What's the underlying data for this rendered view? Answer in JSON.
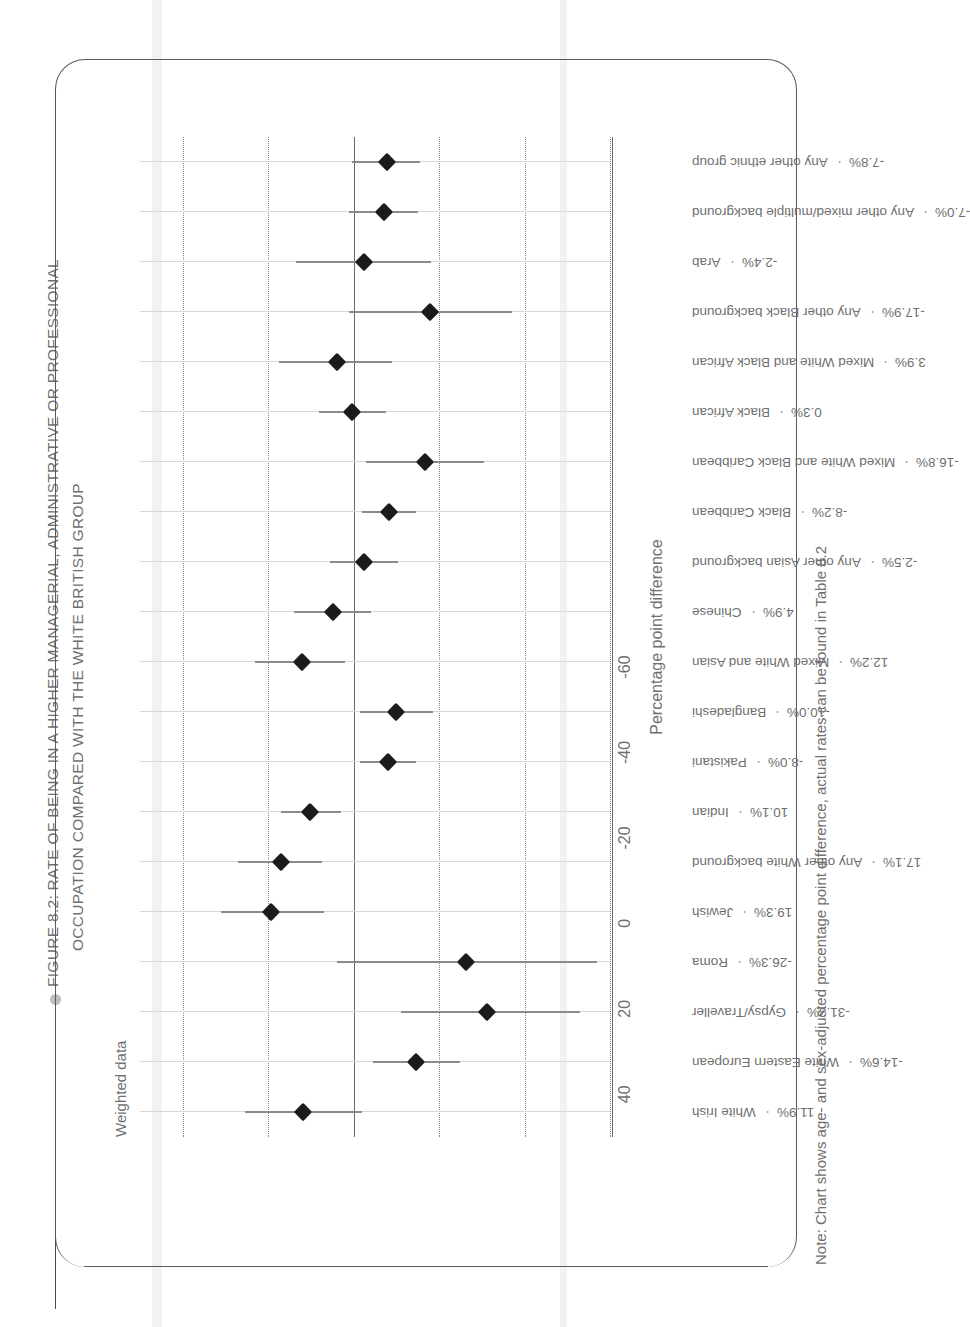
{
  "figure": {
    "title_line1": "FIGURE 8.2: RATE OF BEING IN A HIGHER MANAGERIAL, ADMINISTRATIVE OR PROFESSIONAL",
    "title_line2": "OCCUPATION COMPARED WITH THE WHITE BRITISH GROUP",
    "subtitle": "Weighted data",
    "note": "Note: Chart shows age- and sex-adjusted percentage point difference, actual rates can be found in Table 8.2",
    "dot_separator": "·"
  },
  "chart_data": {
    "type": "scatter",
    "title": "FIGURE 8.2: RATE OF BEING IN A HIGHER MANAGERIAL, ADMINISTRATIVE OR PROFESSIONAL OCCUPATION COMPARED WITH THE WHITE BRITISH GROUP",
    "subtitle": "Weighted data",
    "xlabel": "",
    "ylabel": "Percentage point difference",
    "ylim": [
      -60,
      50
    ],
    "yticks": [
      -60,
      -40,
      -20,
      0,
      20,
      40
    ],
    "ytick_labels": [
      "-60",
      "-40",
      "-20",
      "0",
      "20",
      "40"
    ],
    "grid": "horizontal dotted gridlines at -60, -40, -20, 20, 40; solid reference line at 0",
    "legend": "none",
    "reference_line": 0,
    "marker": "filled black diamond with vertical confidence-interval whiskers",
    "categories": [
      "White Irish",
      "White Eastern European",
      "Gypsy/Traveller",
      "Roma",
      "Jewish",
      "Any other White background",
      "Indian",
      "Pakistani",
      "Bangladeshi",
      "Mixed White and Asian",
      "Chinese",
      "Any other Asian background",
      "Black Caribbean",
      "Mixed White and Black Caribbean",
      "Black African",
      "Mixed White and Black African",
      "Any other Black background",
      "Arab",
      "Any other mixed/multiple background",
      "Any other ethnic group"
    ],
    "value_labels": [
      "11.9%",
      "-14.6%",
      "-31.3%",
      "-26.3%",
      "19.3%",
      "17.1%",
      "10.1%",
      "-8.0%",
      "-10.0%",
      "12.2%",
      "4.9%",
      "-2.5%",
      "-8.2%",
      "-16.8%",
      "0.3%",
      "3.9%",
      "-17.9%",
      "-2.4%",
      "-7.0%",
      "-7.8%"
    ],
    "values": [
      11.9,
      -14.6,
      -31.3,
      -26.3,
      19.3,
      17.1,
      10.1,
      -8.0,
      -10.0,
      12.2,
      4.9,
      -2.5,
      -8.2,
      -16.8,
      0.3,
      3.9,
      -17.9,
      -2.4,
      -7.0,
      -7.8
    ],
    "ci_low": [
      -2.0,
      -25.0,
      -53.0,
      -57.0,
      7.0,
      7.5,
      3.0,
      -14.5,
      -18.5,
      2.0,
      -4.0,
      -10.5,
      -14.5,
      -30.5,
      -7.5,
      -9.0,
      -37.0,
      -18.0,
      -15.0,
      -15.5
    ],
    "ci_high": [
      25.5,
      -4.5,
      -11.0,
      4.0,
      31.0,
      27.0,
      17.0,
      -1.5,
      -1.5,
      23.0,
      14.0,
      5.5,
      -2.0,
      -3.0,
      8.0,
      17.5,
      1.0,
      13.5,
      1.0,
      0.5
    ]
  }
}
